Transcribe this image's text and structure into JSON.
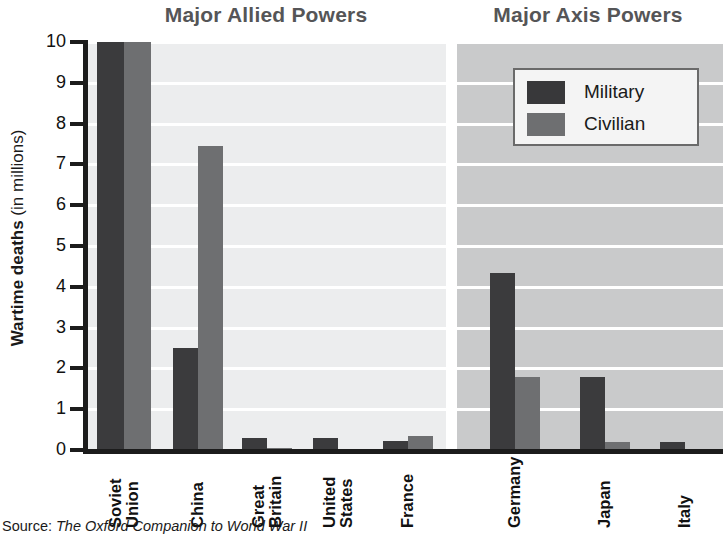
{
  "chart_data": {
    "type": "bar",
    "titles": {
      "allied": "Major Allied Powers",
      "axis": "Major Axis Powers"
    },
    "ylabel_bold": "Wartime deaths",
    "ylabel_rest": " (in millions)",
    "ylabel_full": "Wartime deaths (in millions)",
    "xlabel": "",
    "ylim": [
      0,
      10
    ],
    "yticks": [
      0,
      1,
      2,
      3,
      4,
      5,
      6,
      7,
      8,
      9,
      10
    ],
    "ytick_labels": [
      "0",
      "1",
      "2",
      "3",
      "4",
      "5",
      "6",
      "7",
      "8",
      "9",
      "10"
    ],
    "grid": true,
    "grid_orientation": "horizontal",
    "legend": [
      "Military",
      "Civilian"
    ],
    "legend_position": "upper right (axis panel)",
    "series": [
      {
        "name": "Military",
        "color": "#3b3b3d",
        "values": [
          10.0,
          2.5,
          0.3,
          0.29,
          0.21,
          4.35,
          1.8,
          0.2
        ]
      },
      {
        "name": "Civilian",
        "color": "#6e6f71",
        "values": [
          10.0,
          7.45,
          0.06,
          0.0,
          0.35,
          1.8,
          0.2,
          0.02
        ]
      }
    ],
    "panels": [
      {
        "key": "allied",
        "title": "Major Allied Powers",
        "categories": [
          "Soviet Union",
          "China",
          "Great Britain",
          "United States",
          "France"
        ],
        "category_lines": [
          [
            "Soviet",
            "Union"
          ],
          [
            "China"
          ],
          [
            "Great",
            "Britain"
          ],
          [
            "United",
            "States"
          ],
          [
            "France"
          ]
        ],
        "military": [
          10.0,
          2.5,
          0.3,
          0.29,
          0.21
        ],
        "civilian": [
          10.0,
          7.45,
          0.06,
          0.0,
          0.35
        ],
        "clipped_at_top": [
          "Soviet Union"
        ],
        "background": "#ecedee"
      },
      {
        "key": "axis",
        "title": "Major Axis Powers",
        "categories": [
          "Germany",
          "Japan",
          "Italy"
        ],
        "category_lines": [
          [
            "Germany"
          ],
          [
            "Japan"
          ],
          [
            "Italy"
          ]
        ],
        "military": [
          4.35,
          1.8,
          0.2
        ],
        "civilian": [
          1.8,
          0.2,
          0.02
        ],
        "clipped_at_top": [],
        "background": "#c9cacb"
      }
    ],
    "colors": {
      "military": "#3b3b3d",
      "civilian": "#6e6f71",
      "allied_panel": "#ecedee",
      "axis_panel": "#c9cacb",
      "gridline": "#ffffff",
      "axis_line": "#1c1c1c",
      "title": "#555557"
    }
  },
  "source": {
    "prefix": "Source: ",
    "title": "The Oxford Companion to World War II"
  }
}
